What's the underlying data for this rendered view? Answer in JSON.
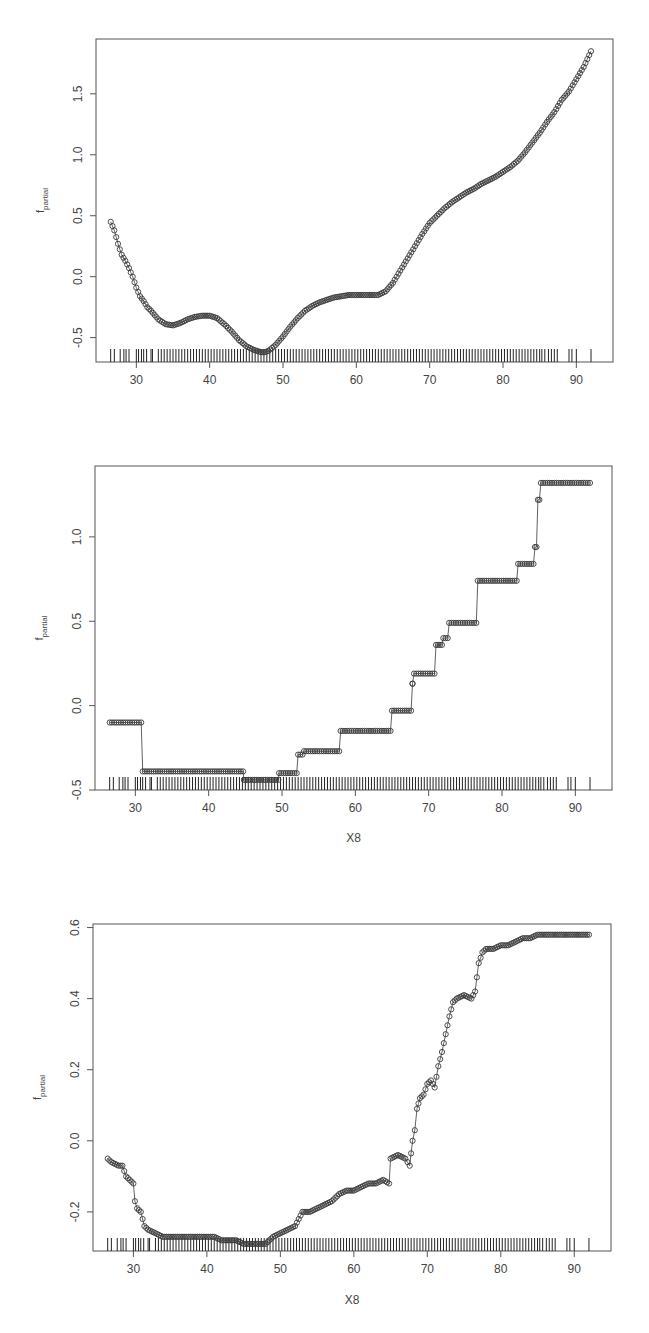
{
  "chart_data": [
    {
      "type": "scatter",
      "title": "",
      "xlabel": "",
      "ylabel": "f_partial",
      "ylabel_main": "f",
      "ylabel_sub": "partial",
      "xlim": [
        24.5,
        95
      ],
      "ylim": [
        -0.7,
        1.95
      ],
      "xticks": [
        30,
        40,
        50,
        60,
        70,
        80,
        90
      ],
      "yticks": [
        -0.5,
        0.0,
        0.5,
        1.0,
        1.5
      ],
      "ytick_labels": [
        "-0.5",
        "0.0",
        "0.5",
        "1.0",
        "1.5"
      ],
      "grid": false,
      "marker": "open-circle",
      "connected_line": true,
      "rug": true,
      "description": "Smooth partial-dependence curve: dips to local min near x=35, small bump near x=40, global min ~-0.62 at x~47.5, plateau ~-0.15 around x=60-63, then rising to ~1.85 at x~92",
      "x": [
        26.5,
        27,
        27.5,
        28,
        28.5,
        29,
        29.5,
        30,
        30.5,
        31,
        31.5,
        32,
        33,
        34,
        35,
        36,
        37,
        38,
        39,
        40,
        41,
        42,
        43,
        44,
        45,
        46,
        47,
        47.5,
        48,
        49,
        50,
        51,
        52,
        53,
        54,
        55,
        56,
        57,
        58,
        59,
        60,
        61,
        62,
        63,
        64,
        65,
        66,
        67,
        68,
        69,
        70,
        71,
        72,
        73,
        74,
        75,
        76,
        77,
        78,
        79,
        80,
        81,
        82,
        83,
        84,
        85,
        86,
        87,
        88,
        89,
        90,
        91,
        92
      ],
      "y": [
        0.45,
        0.38,
        0.27,
        0.18,
        0.13,
        0.07,
        0.0,
        -0.09,
        -0.16,
        -0.2,
        -0.25,
        -0.28,
        -0.35,
        -0.39,
        -0.4,
        -0.38,
        -0.35,
        -0.33,
        -0.32,
        -0.32,
        -0.34,
        -0.39,
        -0.45,
        -0.52,
        -0.57,
        -0.6,
        -0.62,
        -0.62,
        -0.61,
        -0.56,
        -0.49,
        -0.41,
        -0.34,
        -0.28,
        -0.24,
        -0.21,
        -0.19,
        -0.17,
        -0.16,
        -0.15,
        -0.15,
        -0.15,
        -0.15,
        -0.15,
        -0.12,
        -0.05,
        0.05,
        0.15,
        0.25,
        0.35,
        0.44,
        0.5,
        0.56,
        0.61,
        0.65,
        0.69,
        0.72,
        0.76,
        0.79,
        0.82,
        0.86,
        0.9,
        0.95,
        1.02,
        1.1,
        1.18,
        1.27,
        1.35,
        1.45,
        1.52,
        1.62,
        1.72,
        1.85
      ],
      "rug_x": [
        26.5,
        27,
        27.8,
        28.3,
        28.6,
        29,
        30,
        30.3,
        30.7,
        31,
        31.4,
        32,
        32.2,
        33,
        33.4,
        33.8,
        34.2,
        34.6,
        35,
        35.4,
        35.8,
        36.2,
        36.6,
        37,
        37.4,
        37.8,
        38.2,
        38.6,
        39,
        39.4,
        39.8,
        40.2,
        40.6,
        41,
        41.4,
        41.8,
        42.2,
        42.6,
        43,
        43.4,
        43.8,
        44.2,
        44.6,
        45,
        45.4,
        45.8,
        46.2,
        46.6,
        47,
        47.4,
        47.8,
        48.2,
        48.6,
        49,
        49.4,
        49.8,
        50.2,
        50.6,
        51,
        51.4,
        51.8,
        52.2,
        52.6,
        53,
        53.4,
        53.8,
        54.2,
        54.6,
        55,
        55.4,
        55.8,
        56.2,
        56.6,
        57,
        57.4,
        57.8,
        58.2,
        58.6,
        59,
        59.4,
        59.8,
        60.2,
        60.6,
        61,
        61.4,
        61.8,
        62.2,
        62.6,
        63,
        63.4,
        63.8,
        64.2,
        64.6,
        65,
        65.4,
        65.8,
        66.2,
        66.6,
        67,
        67.4,
        67.8,
        68.2,
        68.6,
        69,
        69.4,
        69.8,
        70.2,
        70.6,
        71,
        71.4,
        71.8,
        72.2,
        72.6,
        73,
        73.4,
        73.8,
        74.2,
        74.6,
        75,
        75.4,
        75.8,
        76.2,
        76.6,
        77,
        77.4,
        77.8,
        78.2,
        78.6,
        79,
        79.4,
        79.8,
        80.2,
        80.6,
        81,
        81.4,
        81.8,
        82.2,
        82.6,
        83,
        83.4,
        83.8,
        84.2,
        84.6,
        85,
        85.3,
        85.7,
        86.2,
        86.6,
        87,
        87.4,
        89,
        89.4,
        90,
        92
      ]
    },
    {
      "type": "scatter",
      "title": "",
      "xlabel": "X8",
      "ylabel": "f_partial",
      "ylabel_main": "f",
      "ylabel_sub": "partial",
      "xlim": [
        24.5,
        95
      ],
      "ylim": [
        -0.5,
        1.42
      ],
      "xticks": [
        30,
        40,
        50,
        60,
        70,
        80,
        90
      ],
      "yticks": [
        -0.5,
        0.0,
        0.5,
        1.0
      ],
      "ytick_labels": [
        "-0.5",
        "0.0",
        "0.5",
        "1.0"
      ],
      "grid": false,
      "marker": "open-circle",
      "connected_line": true,
      "rug": true,
      "description": "Step-function partial dependence (tree ensemble), rising in discrete steps from -0.1 (x<31) to 1.32 (x>85)",
      "steps": [
        {
          "x_start": 26.5,
          "x_end": 30.8,
          "y": -0.1
        },
        {
          "x_start": 31.0,
          "x_end": 44.7,
          "y": -0.39
        },
        {
          "x_start": 44.8,
          "x_end": 49.5,
          "y": -0.44
        },
        {
          "x_start": 49.6,
          "x_end": 52.0,
          "y": -0.4
        },
        {
          "x_start": 52.2,
          "x_end": 52.8,
          "y": -0.29
        },
        {
          "x_start": 53.0,
          "x_end": 57.8,
          "y": -0.27
        },
        {
          "x_start": 58.0,
          "x_end": 64.8,
          "y": -0.15
        },
        {
          "x_start": 65.0,
          "x_end": 67.6,
          "y": -0.03
        },
        {
          "x_start": 67.8,
          "x_end": 67.8,
          "y": 0.13
        },
        {
          "x_start": 68.0,
          "x_end": 70.8,
          "y": 0.19
        },
        {
          "x_start": 71.0,
          "x_end": 71.8,
          "y": 0.36
        },
        {
          "x_start": 72.0,
          "x_end": 72.6,
          "y": 0.4
        },
        {
          "x_start": 72.8,
          "x_end": 76.5,
          "y": 0.49
        },
        {
          "x_start": 76.7,
          "x_end": 82.0,
          "y": 0.74
        },
        {
          "x_start": 82.2,
          "x_end": 84.3,
          "y": 0.84
        },
        {
          "x_start": 84.5,
          "x_end": 84.7,
          "y": 0.94
        },
        {
          "x_start": 84.9,
          "x_end": 85.1,
          "y": 1.22
        },
        {
          "x_start": 85.3,
          "x_end": 92.0,
          "y": 1.32
        }
      ],
      "rug_x": [
        26.5,
        27,
        27.8,
        28.3,
        28.6,
        29,
        30,
        30.3,
        30.7,
        31,
        31.4,
        32,
        32.2,
        33,
        33.4,
        33.8,
        34.2,
        34.6,
        35,
        35.4,
        35.8,
        36.2,
        36.6,
        37,
        37.4,
        37.8,
        38.2,
        38.6,
        39,
        39.4,
        39.8,
        40.2,
        40.6,
        41,
        41.4,
        41.8,
        42.2,
        42.6,
        43,
        43.4,
        43.8,
        44.2,
        44.6,
        45,
        45.4,
        45.8,
        46.2,
        46.6,
        47,
        47.4,
        47.8,
        48.2,
        48.6,
        49,
        49.4,
        49.8,
        50.2,
        50.6,
        51,
        51.4,
        51.8,
        52.2,
        52.6,
        53,
        53.4,
        53.8,
        54.2,
        54.6,
        55,
        55.4,
        55.8,
        56.2,
        56.6,
        57,
        57.4,
        57.8,
        58.2,
        58.6,
        59,
        59.4,
        59.8,
        60.2,
        60.6,
        61,
        61.4,
        61.8,
        62.2,
        62.6,
        63,
        63.4,
        63.8,
        64.2,
        64.6,
        65,
        65.4,
        65.8,
        66.2,
        66.6,
        67,
        67.4,
        67.8,
        68.2,
        68.6,
        69,
        69.4,
        69.8,
        70.2,
        70.6,
        71,
        71.4,
        71.8,
        72.2,
        72.6,
        73,
        73.4,
        73.8,
        74.2,
        74.6,
        75,
        75.4,
        75.8,
        76.2,
        76.6,
        77,
        77.4,
        77.8,
        78.2,
        78.6,
        79,
        79.4,
        79.8,
        80.2,
        80.6,
        81,
        81.4,
        81.8,
        82.2,
        82.6,
        83,
        83.4,
        83.8,
        84.2,
        84.6,
        85,
        85.3,
        85.7,
        86.2,
        86.6,
        87,
        87.4,
        89,
        89.4,
        90,
        92
      ]
    },
    {
      "type": "scatter",
      "title": "",
      "xlabel": "X8",
      "ylabel": "f_partial",
      "ylabel_main": "f",
      "ylabel_sub": "partial",
      "xlim": [
        24.5,
        95
      ],
      "ylim": [
        -0.31,
        0.61
      ],
      "xticks": [
        30,
        40,
        50,
        60,
        70,
        80,
        90
      ],
      "yticks": [
        -0.2,
        0.0,
        0.2,
        0.4,
        0.6
      ],
      "ytick_labels": [
        "-0.2",
        "0.0",
        "0.2",
        "0.4",
        "0.6"
      ],
      "grid": false,
      "marker": "open-circle",
      "connected_line": true,
      "rug": true,
      "description": "Noisy stepwise partial dependence: starts ~-0.05 at x=26.5, drops to ~-0.27 by x=34, bottoms ~-0.29 at x 45-48, rises gradually to ~-0.05 at x=67, sharp rise to ~0.4 by x=73, jump to ~0.53 at x=77, flattens ~0.58 after x=85",
      "x": [
        26.5,
        27,
        28,
        28.5,
        29,
        29.5,
        30,
        30.2,
        30.5,
        31,
        31.5,
        32,
        33,
        34,
        35,
        36,
        37,
        38,
        39,
        40,
        41,
        42,
        43,
        44,
        45,
        46,
        47,
        48,
        49,
        50,
        51,
        52,
        53,
        54,
        55,
        56,
        57,
        58,
        59,
        60,
        61,
        62,
        63,
        64,
        64.8,
        65,
        66,
        67,
        67.6,
        68,
        68.3,
        68.6,
        69,
        69.5,
        70,
        70.5,
        71,
        71.5,
        72,
        72.5,
        73,
        73.5,
        74,
        75,
        76,
        76.5,
        77,
        77.5,
        78,
        79,
        80,
        81,
        82,
        83,
        84,
        85,
        86,
        87,
        89,
        89.5,
        92
      ],
      "y": [
        -0.05,
        -0.06,
        -0.07,
        -0.07,
        -0.1,
        -0.11,
        -0.12,
        -0.17,
        -0.19,
        -0.2,
        -0.24,
        -0.25,
        -0.26,
        -0.27,
        -0.27,
        -0.27,
        -0.27,
        -0.27,
        -0.27,
        -0.27,
        -0.27,
        -0.28,
        -0.28,
        -0.28,
        -0.29,
        -0.29,
        -0.29,
        -0.29,
        -0.27,
        -0.26,
        -0.25,
        -0.24,
        -0.2,
        -0.2,
        -0.19,
        -0.18,
        -0.17,
        -0.15,
        -0.14,
        -0.14,
        -0.13,
        -0.12,
        -0.12,
        -0.11,
        -0.12,
        -0.05,
        -0.04,
        -0.05,
        -0.07,
        0.0,
        0.03,
        0.09,
        0.12,
        0.13,
        0.16,
        0.17,
        0.15,
        0.21,
        0.25,
        0.3,
        0.35,
        0.39,
        0.4,
        0.41,
        0.4,
        0.42,
        0.5,
        0.53,
        0.54,
        0.54,
        0.55,
        0.55,
        0.56,
        0.57,
        0.57,
        0.58,
        0.58,
        0.58,
        0.58,
        0.58,
        0.58
      ],
      "rug_x": [
        26.5,
        27,
        27.8,
        28.3,
        28.6,
        29,
        30,
        30.3,
        30.7,
        31,
        31.4,
        32,
        32.2,
        33,
        33.4,
        33.8,
        34.2,
        34.6,
        35,
        35.4,
        35.8,
        36.2,
        36.6,
        37,
        37.4,
        37.8,
        38.2,
        38.6,
        39,
        39.4,
        39.8,
        40.2,
        40.6,
        41,
        41.4,
        41.8,
        42.2,
        42.6,
        43,
        43.4,
        43.8,
        44.2,
        44.6,
        45,
        45.4,
        45.8,
        46.2,
        46.6,
        47,
        47.4,
        47.8,
        48.2,
        48.6,
        49,
        49.4,
        49.8,
        50.2,
        50.6,
        51,
        51.4,
        51.8,
        52.2,
        52.6,
        53,
        53.4,
        53.8,
        54.2,
        54.6,
        55,
        55.4,
        55.8,
        56.2,
        56.6,
        57,
        57.4,
        57.8,
        58.2,
        58.6,
        59,
        59.4,
        59.8,
        60.2,
        60.6,
        61,
        61.4,
        61.8,
        62.2,
        62.6,
        63,
        63.4,
        63.8,
        64.2,
        64.6,
        65,
        65.4,
        65.8,
        66.2,
        66.6,
        67,
        67.4,
        67.8,
        68.2,
        68.6,
        69,
        69.4,
        69.8,
        70.2,
        70.6,
        71,
        71.4,
        71.8,
        72.2,
        72.6,
        73,
        73.4,
        73.8,
        74.2,
        74.6,
        75,
        75.4,
        75.8,
        76.2,
        76.6,
        77,
        77.4,
        77.8,
        78.2,
        78.6,
        79,
        79.4,
        79.8,
        80.2,
        80.6,
        81,
        81.4,
        81.8,
        82.2,
        82.6,
        83,
        83.4,
        83.8,
        84.2,
        84.6,
        85,
        85.3,
        85.7,
        86.2,
        86.6,
        87,
        87.4,
        89,
        89.4,
        90,
        92
      ]
    }
  ],
  "layout": {
    "panels": [
      {
        "left": 96,
        "top": 39,
        "right": 613,
        "bottom": 362,
        "xlabel_y": null
      },
      {
        "left": 95,
        "top": 466,
        "right": 612,
        "bottom": 790,
        "xlabel_y": 842
      },
      {
        "left": 93,
        "top": 924,
        "right": 611,
        "bottom": 1251,
        "xlabel_y": 1304
      }
    ]
  },
  "colors": {
    "axis": "#555555",
    "point": "#3a3a3a",
    "rug": "#222222",
    "text": "#444444",
    "background": "#ffffff"
  }
}
